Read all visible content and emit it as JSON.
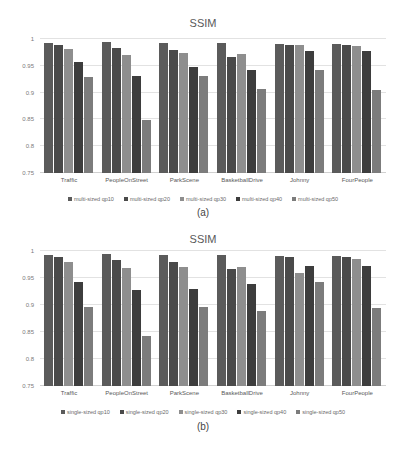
{
  "colors": {
    "qp10": "#5b5b5b",
    "qp20": "#4a4a4a",
    "qp30": "#8e8e8e",
    "qp40": "#3d3d3d",
    "qp50": "#7c7c7c"
  },
  "panels": [
    {
      "sublabel": "(a)",
      "title": "SSIM",
      "yticks": [
        "1",
        "0.95",
        "0.9",
        "0.85",
        "0.8",
        "0.75"
      ],
      "legend": [
        "multi-sized qp10",
        "multi-sized qp20",
        "multi-sized qp30",
        "multi-sized qp40",
        "multi-sized qp50"
      ],
      "categories": [
        "Traffic",
        "PeopleOnStreet",
        "ParkScene",
        "BasketballDrive",
        "Johnny",
        "FourPeople"
      ]
    },
    {
      "sublabel": "(b)",
      "title": "SSIM",
      "yticks": [
        "1",
        "0.95",
        "0.9",
        "0.85",
        "0.8",
        "0.75"
      ],
      "legend": [
        "single-sized qp10",
        "single-sized qp20",
        "single-sized qp30",
        "single-sized qp40",
        "single-sized qp50"
      ],
      "categories": [
        "Traffic",
        "PeopleOnStreet",
        "ParkScene",
        "BasketballDrive",
        "Johnny",
        "FourPeople"
      ]
    }
  ],
  "chart_data": [
    {
      "type": "bar",
      "title": "SSIM",
      "subtitle": "(a)",
      "xlabel": "",
      "ylabel": "",
      "ylim": [
        0.75,
        1.0
      ],
      "yticks": [
        0.75,
        0.8,
        0.85,
        0.9,
        0.95,
        1.0
      ],
      "grid": true,
      "legend_position": "bottom",
      "categories": [
        "Traffic",
        "PeopleOnStreet",
        "ParkScene",
        "BasketballDrive",
        "Johnny",
        "FourPeople"
      ],
      "series": [
        {
          "name": "multi-sized qp10",
          "values": [
            0.993,
            0.995,
            0.993,
            0.993,
            0.99,
            0.991
          ]
        },
        {
          "name": "multi-sized qp20",
          "values": [
            0.989,
            0.984,
            0.98,
            0.967,
            0.988,
            0.988
          ]
        },
        {
          "name": "multi-sized qp30",
          "values": [
            0.982,
            0.971,
            0.973,
            0.972,
            0.989,
            0.987
          ]
        },
        {
          "name": "multi-sized qp40",
          "values": [
            0.957,
            0.931,
            0.947,
            0.942,
            0.977,
            0.977
          ]
        },
        {
          "name": "multi-sized qp50",
          "values": [
            0.93,
            0.849,
            0.931,
            0.906,
            0.943,
            0.904
          ]
        }
      ]
    },
    {
      "type": "bar",
      "title": "SSIM",
      "subtitle": "(b)",
      "xlabel": "",
      "ylabel": "",
      "ylim": [
        0.75,
        1.0
      ],
      "yticks": [
        0.75,
        0.8,
        0.85,
        0.9,
        0.95,
        1.0
      ],
      "grid": true,
      "legend_position": "bottom",
      "categories": [
        "Traffic",
        "PeopleOnStreet",
        "ParkScene",
        "BasketballDrive",
        "Johnny",
        "FourPeople"
      ],
      "series": [
        {
          "name": "single-sized qp10",
          "values": [
            0.993,
            0.995,
            0.993,
            0.993,
            0.99,
            0.991
          ]
        },
        {
          "name": "single-sized qp20",
          "values": [
            0.988,
            0.984,
            0.98,
            0.966,
            0.988,
            0.988
          ]
        },
        {
          "name": "single-sized qp30",
          "values": [
            0.979,
            0.969,
            0.97,
            0.971,
            0.96,
            0.985
          ]
        },
        {
          "name": "single-sized qp40",
          "values": [
            0.943,
            0.928,
            0.929,
            0.938,
            0.973,
            0.973
          ]
        },
        {
          "name": "single-sized qp50",
          "values": [
            0.896,
            0.843,
            0.897,
            0.889,
            0.943,
            0.894
          ]
        }
      ]
    }
  ]
}
